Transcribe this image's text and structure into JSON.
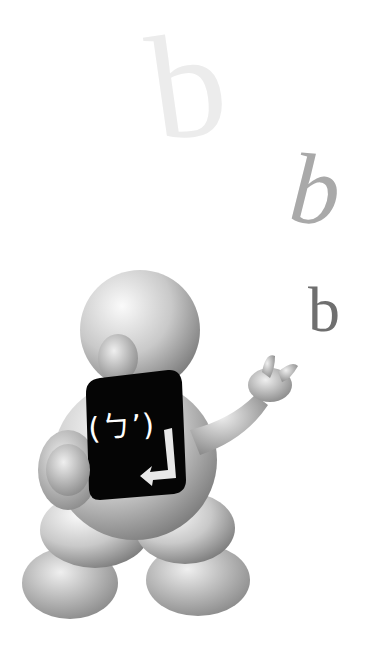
{
  "scene": {
    "description": "3D figure holding a black keyboard keycap, looking at floating letters",
    "floating_letters": [
      {
        "char": "b",
        "style": "large faded upright",
        "color": "#ececec"
      },
      {
        "char": "b",
        "style": "italic medium gray",
        "color": "#a9a9a9"
      },
      {
        "char": "b",
        "style": "upright small dark gray",
        "color": "#6f6f6f"
      }
    ],
    "keycap": {
      "label": "(ㄅ’)",
      "icon": "enter-arrow-icon",
      "color": "#000000",
      "text_color": "#ffffff"
    }
  }
}
